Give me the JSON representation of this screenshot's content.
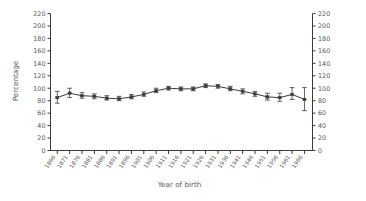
{
  "chart_data": {
    "type": "line",
    "title": "",
    "subtitle": "",
    "xlabel": "Year of birth",
    "ylabel": "Percentage",
    "ylim": [
      0,
      220
    ],
    "ytick_step": 20,
    "yticks": [
      0,
      20,
      40,
      60,
      80,
      100,
      120,
      140,
      160,
      180,
      200,
      220
    ],
    "yticks_right": [
      0,
      20,
      40,
      60,
      80,
      100,
      120,
      140,
      160,
      180,
      200,
      220
    ],
    "grid": false,
    "legend": null,
    "legend_position": "none",
    "dual_axis": true,
    "error_bars": true,
    "marker": "square",
    "categories": [
      "1866",
      "1871",
      "1876",
      "1881",
      "1886",
      "1891",
      "1896",
      "1901",
      "1906",
      "1911",
      "1916",
      "1921",
      "1926",
      "1931",
      "1936",
      "1941",
      "1946",
      "1951",
      "1956",
      "1961",
      "1966"
    ],
    "x": [
      1866,
      1871,
      1876,
      1881,
      1886,
      1891,
      1896,
      1901,
      1906,
      1911,
      1916,
      1921,
      1926,
      1931,
      1936,
      1941,
      1946,
      1951,
      1956,
      1961,
      1966
    ],
    "values": [
      85,
      92,
      88,
      87,
      84,
      83,
      86,
      90,
      96,
      100,
      99,
      99,
      104,
      103,
      99,
      95,
      91,
      86,
      85,
      90,
      82
    ],
    "err_low": [
      76,
      85,
      84,
      83,
      81,
      80,
      83,
      87,
      93,
      97,
      96,
      96,
      101,
      100,
      96,
      91,
      87,
      81,
      79,
      82,
      64
    ],
    "err_high": [
      95,
      100,
      93,
      91,
      88,
      87,
      90,
      94,
      100,
      103,
      102,
      102,
      107,
      106,
      103,
      99,
      95,
      92,
      92,
      101,
      101
    ],
    "series": [
      {
        "name": "Percentage",
        "values": [
          85,
          92,
          88,
          87,
          84,
          83,
          86,
          90,
          96,
          100,
          99,
          99,
          104,
          103,
          99,
          95,
          91,
          86,
          85,
          90,
          82
        ]
      }
    ]
  },
  "axes": {
    "y_label": "Percentage",
    "x_label": "Year of birth",
    "y_tick_labels_left": [
      "220",
      "200",
      "180",
      "160",
      "140",
      "120",
      "100",
      "80",
      "60",
      "40",
      "20",
      "0"
    ],
    "y_tick_labels_right": [
      "220",
      "200",
      "180",
      "160",
      "140",
      "120",
      "100",
      "80",
      "60",
      "40",
      "20",
      "0"
    ]
  },
  "colors": {
    "line": "#3c3c3c",
    "axis": "#3b3b3b",
    "text": "#59595b",
    "background": "#ffffff"
  }
}
